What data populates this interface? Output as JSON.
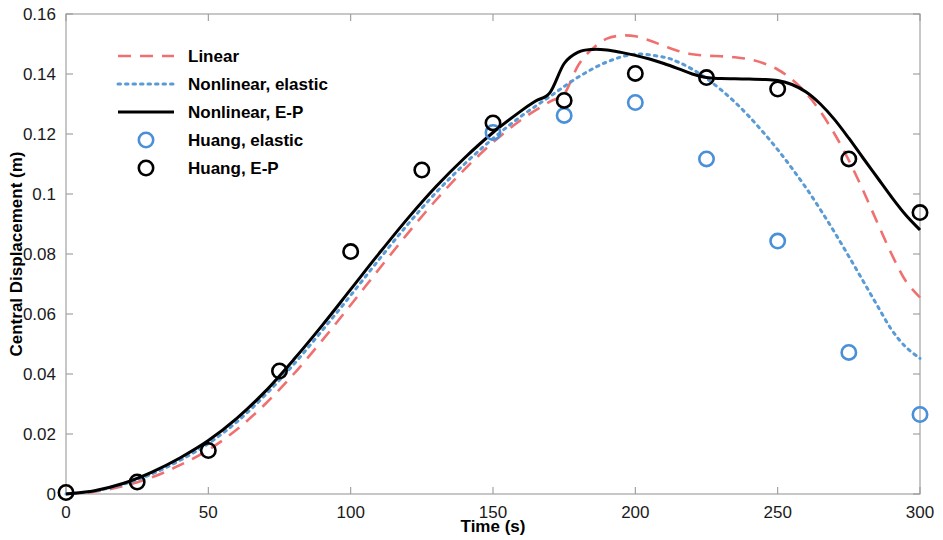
{
  "chart_data": {
    "type": "line",
    "title": "",
    "xlabel": "Time (s)",
    "ylabel": "Central Displacement (m)",
    "xlim": [
      0,
      300
    ],
    "ylim": [
      0,
      0.16
    ],
    "xticks": [
      "0",
      "50",
      "100",
      "150",
      "200",
      "250",
      "300"
    ],
    "yticks": [
      "0",
      "0.02",
      "0.04",
      "0.06",
      "0.08",
      "0.1",
      "0.12",
      "0.14",
      "0.16"
    ],
    "grid": false,
    "legend_position": "upper left",
    "colors": {
      "linear": "#F07070",
      "nonlinear_elastic": "#5B9BD5",
      "nonlinear_ep": "#000000",
      "huang_elastic": "#4A90D9",
      "huang_ep": "#000000",
      "axis": "#9A9A9A"
    },
    "series": [
      {
        "name": "Linear",
        "style": "dashed",
        "color": "#F07070",
        "x": [
          0,
          10,
          20,
          30,
          40,
          50,
          60,
          70,
          80,
          90,
          100,
          110,
          120,
          130,
          140,
          150,
          160,
          170,
          175,
          180,
          185,
          190,
          195,
          200,
          205,
          210,
          215,
          220,
          225,
          230,
          235,
          240,
          245,
          250,
          255,
          260,
          265,
          270,
          275,
          280,
          285,
          290,
          295,
          300
        ],
        "y": [
          0.0,
          0.0008,
          0.0026,
          0.0055,
          0.0096,
          0.0147,
          0.0215,
          0.03,
          0.04,
          0.0512,
          0.063,
          0.075,
          0.0868,
          0.098,
          0.1082,
          0.1172,
          0.1248,
          0.1308,
          0.1333,
          0.143,
          0.1485,
          0.1518,
          0.1528,
          0.1526,
          0.1512,
          0.1494,
          0.1477,
          0.1466,
          0.1461,
          0.1459,
          0.1456,
          0.1449,
          0.1436,
          0.1415,
          0.1382,
          0.1336,
          0.1275,
          0.12,
          0.1112,
          0.1012,
          0.0905,
          0.08,
          0.071,
          0.0655
        ]
      },
      {
        "name": "Nonlinear, elastic",
        "style": "dotted",
        "color": "#5B9BD5",
        "x": [
          0,
          10,
          20,
          30,
          40,
          50,
          60,
          70,
          80,
          90,
          100,
          110,
          120,
          130,
          140,
          150,
          160,
          170,
          180,
          190,
          200,
          210,
          215,
          220,
          225,
          230,
          235,
          240,
          245,
          250,
          255,
          260,
          265,
          270,
          275,
          280,
          285,
          290,
          295,
          300
        ],
        "y": [
          0.0,
          0.001,
          0.0032,
          0.0066,
          0.0112,
          0.0168,
          0.024,
          0.033,
          0.0432,
          0.0545,
          0.0662,
          0.0782,
          0.0898,
          0.1005,
          0.11,
          0.1185,
          0.126,
          0.1325,
          0.139,
          0.144,
          0.1466,
          0.1456,
          0.144,
          0.1416,
          0.1385,
          0.1348,
          0.1306,
          0.1258,
          0.1205,
          0.1148,
          0.1086,
          0.102,
          0.0948,
          0.0872,
          0.0792,
          0.071,
          0.0628,
          0.0548,
          0.049,
          0.0452
        ]
      },
      {
        "name": "Nonlinear, E-P",
        "style": "solid",
        "color": "#000000",
        "x": [
          0,
          10,
          20,
          30,
          40,
          50,
          60,
          70,
          80,
          90,
          100,
          110,
          120,
          130,
          140,
          150,
          160,
          165,
          170,
          175,
          180,
          185,
          190,
          195,
          200,
          205,
          210,
          215,
          220,
          225,
          230,
          235,
          240,
          245,
          250,
          255,
          260,
          265,
          270,
          275,
          280,
          285,
          290,
          295,
          300
        ],
        "y": [
          0.0,
          0.0011,
          0.0035,
          0.0072,
          0.012,
          0.0178,
          0.0252,
          0.0342,
          0.0448,
          0.0562,
          0.0682,
          0.0802,
          0.0918,
          0.1025,
          0.112,
          0.1205,
          0.1278,
          0.131,
          0.1338,
          0.1435,
          0.1473,
          0.1482,
          0.148,
          0.1472,
          0.1462,
          0.145,
          0.1435,
          0.1418,
          0.14,
          0.1388,
          0.1385,
          0.1384,
          0.1383,
          0.1382,
          0.1378,
          0.1365,
          0.134,
          0.13,
          0.1248,
          0.1186,
          0.112,
          0.1055,
          0.099,
          0.093,
          0.088
        ]
      }
    ],
    "scatter": [
      {
        "name": "Huang, elastic",
        "marker": "open-circle",
        "color": "#4A90D9",
        "x": [
          150,
          175,
          200,
          225,
          250,
          275,
          300
        ],
        "y": [
          0.1205,
          0.1262,
          0.1305,
          0.1117,
          0.0843,
          0.0472,
          0.0265
        ]
      },
      {
        "name": "Huang, E-P",
        "marker": "open-circle",
        "color": "#000000",
        "x": [
          0,
          25,
          50,
          75,
          100,
          125,
          150,
          175,
          200,
          225,
          250,
          275,
          300
        ],
        "y": [
          0.0005,
          0.004,
          0.0145,
          0.041,
          0.0808,
          0.108,
          0.1237,
          0.1312,
          0.1402,
          0.1388,
          0.135,
          0.1117,
          0.0938
        ]
      }
    ]
  },
  "legend": {
    "items": [
      {
        "label": "Linear",
        "style": "dashed",
        "color": "#F07070"
      },
      {
        "label": "Nonlinear, elastic",
        "style": "dotted",
        "color": "#5B9BD5"
      },
      {
        "label": "Nonlinear, E-P",
        "style": "solid",
        "color": "#000000"
      },
      {
        "label": "Huang, elastic",
        "style": "marker",
        "color": "#4A90D9"
      },
      {
        "label": "Huang, E-P",
        "style": "marker",
        "color": "#000000"
      }
    ]
  },
  "axes": {
    "x_label": "Time (s)",
    "y_label": "Central Displacement (m)"
  }
}
